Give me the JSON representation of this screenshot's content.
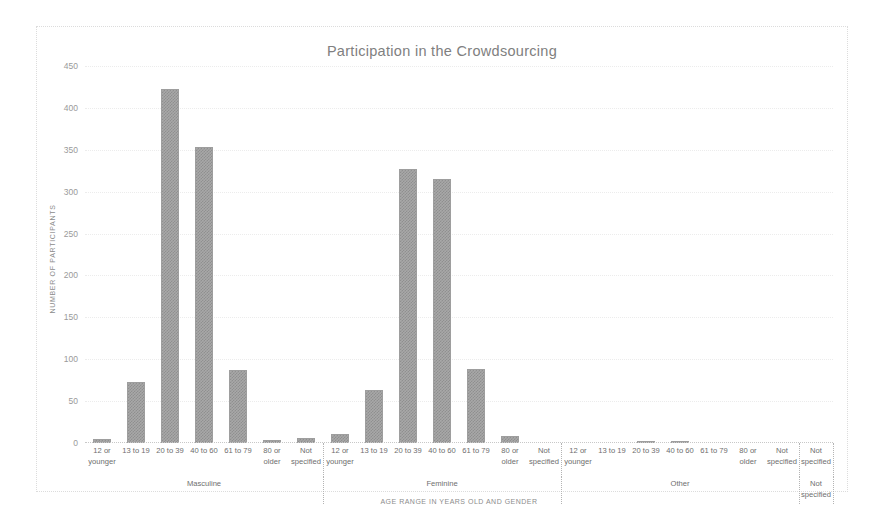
{
  "chart_data": {
    "type": "bar",
    "title": "Participation in the Crowdsourcing",
    "xlabel": "AGE RANGE IN YEARS OLD AND GENDER",
    "ylabel": "NUMBER OF PARTICIPANTS",
    "ylim": [
      0,
      450
    ],
    "ytick_labels": [
      "0",
      "50",
      "100",
      "150",
      "200",
      "250",
      "300",
      "350",
      "400",
      "450"
    ],
    "ytick_values": [
      0,
      50,
      100,
      150,
      200,
      250,
      300,
      350,
      400,
      450
    ],
    "grid": true,
    "legend": "none",
    "bar_color": "#a8a8a8",
    "bar_pattern": "checkered-gray",
    "groups": [
      {
        "name": "Masculine",
        "categories": [
          "12 or younger",
          "13 to 19",
          "20 to 39",
          "40 to 60",
          "61 to 79",
          "80 or older",
          "Not specified"
        ],
        "values": [
          5,
          73,
          422,
          353,
          87,
          4,
          6
        ]
      },
      {
        "name": "Feminine",
        "categories": [
          "12 or younger",
          "13 to 19",
          "20 to 39",
          "40 to 60",
          "61 to 79",
          "80 or older",
          "Not specified"
        ],
        "values": [
          11,
          63,
          327,
          315,
          88,
          8,
          0
        ]
      },
      {
        "name": "Other",
        "categories": [
          "12 or younger",
          "13 to 19",
          "20 to 39",
          "40 to 60",
          "61 to 79",
          "80 or older",
          "Not specified"
        ],
        "values": [
          0,
          0,
          3,
          2,
          0,
          0,
          0
        ]
      },
      {
        "name": "Not specified",
        "categories": [
          "Not specified"
        ],
        "values": [
          0
        ]
      }
    ]
  }
}
